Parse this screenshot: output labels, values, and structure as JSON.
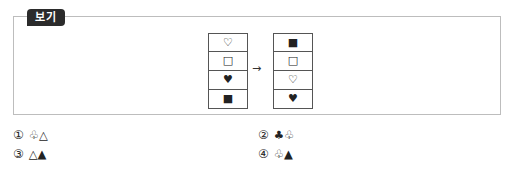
{
  "box": {
    "tag_label": "보기",
    "before_column": [
      "♡",
      "□",
      "♥",
      "■"
    ],
    "arrow": "→",
    "after_column": [
      "■",
      "□",
      "♡",
      "♥"
    ]
  },
  "choices": [
    {
      "number": "①",
      "text": "♧△"
    },
    {
      "number": "②",
      "text": "♣♧"
    },
    {
      "number": "③",
      "text": "△▲"
    },
    {
      "number": "④",
      "text": "♧▲"
    }
  ]
}
